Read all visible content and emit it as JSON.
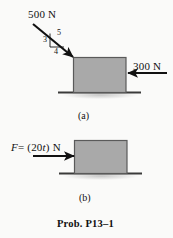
{
  "figure": {
    "caption": "Prob. P13–1",
    "background_color": "#fafaf9",
    "block_fill": "#a9a9a9",
    "block_stroke": "#555555",
    "ground_color": "#3a3a3a",
    "arrow_color": "#111111"
  },
  "part_a": {
    "part_label": "(a)",
    "applied_force_label": "500 N",
    "resisting_force_label": "300 N",
    "slope_triangle": {
      "vertical_label": "3",
      "hypotenuse_label": "5",
      "horizontal_label": "4"
    }
  },
  "part_b": {
    "part_label": "(b)",
    "force_expression_prefix": "F",
    "force_expression_equals": "= (20",
    "force_expression_variable": "t",
    "force_expression_suffix": ") N"
  }
}
